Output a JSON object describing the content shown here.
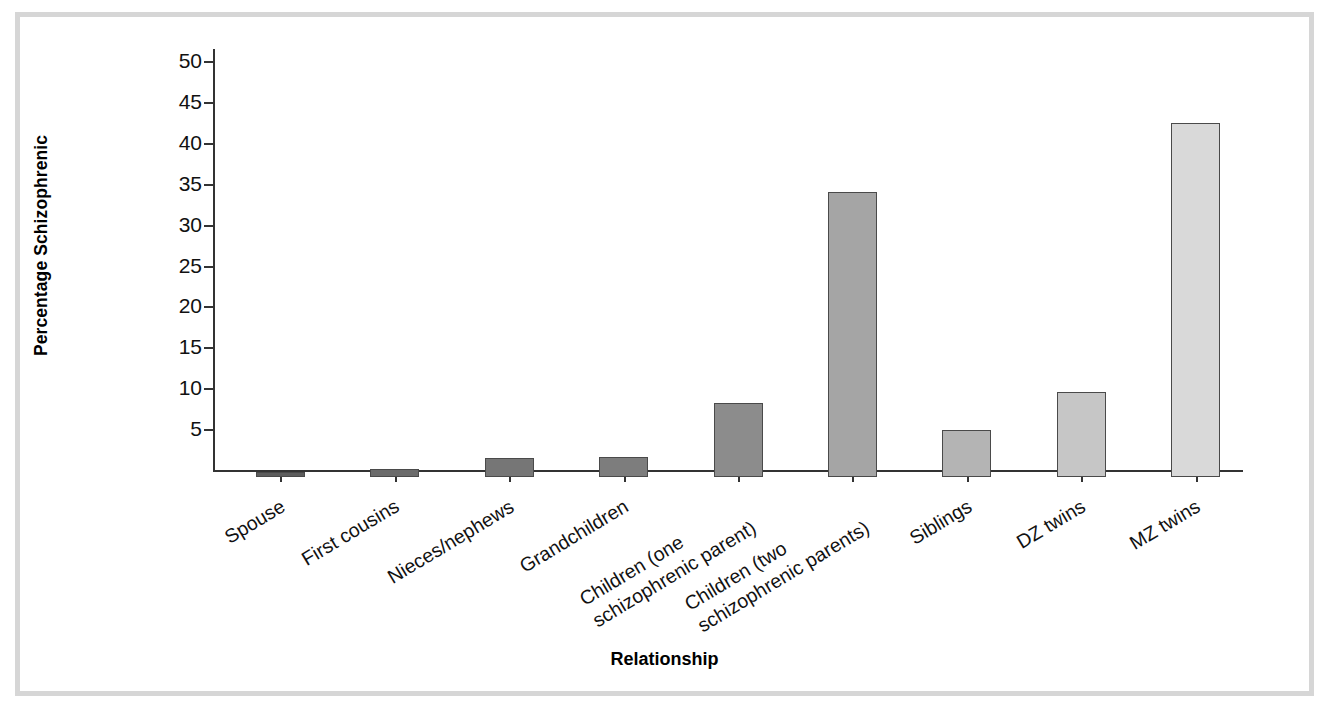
{
  "chart_data": {
    "type": "bar",
    "title": "",
    "xlabel": "Relationship",
    "ylabel": "Percentage Schizophrenic",
    "ylim": [
      0,
      50
    ],
    "ytick_step": 5,
    "yticks": [
      5,
      10,
      15,
      20,
      25,
      30,
      35,
      40,
      45,
      50
    ],
    "grid": false,
    "legend": null,
    "categories": [
      "Spouse",
      "First cousins",
      "Nieces/nephews",
      "Grandchildren",
      "Children (one schizophrenic parent)",
      "Children (two schizophrenic parents)",
      "Siblings",
      "DZ twins",
      "MZ twins"
    ],
    "values": [
      0.6,
      1.0,
      2.3,
      2.4,
      9.1,
      34.9,
      5.8,
      10.4,
      43.3
    ],
    "bar_colors": [
      "#5d5d5d",
      "#6b6b6b",
      "#767676",
      "#7d7d7d",
      "#8c8c8c",
      "#a5a5a5",
      "#b4b4b4",
      "#c6c6c6",
      "#d9d9d9"
    ],
    "bar_edge_color": "#4a4a4a"
  },
  "axis": {
    "y_tick_labels": [
      "5",
      "10",
      "15",
      "20",
      "25",
      "30",
      "35",
      "40",
      "45",
      "50"
    ],
    "y_title": "Percentage Schizophrenic",
    "x_title": "Relationship"
  },
  "category_labels": [
    {
      "line1": "Spouse",
      "line2": ""
    },
    {
      "line1": "First cousins",
      "line2": ""
    },
    {
      "line1": "Nieces/nephews",
      "line2": ""
    },
    {
      "line1": "Grandchildren",
      "line2": ""
    },
    {
      "line1": "Children (one",
      "line2": "schizophrenic parent)"
    },
    {
      "line1": "Children (two",
      "line2": "schizophrenic parents)"
    },
    {
      "line1": "Siblings",
      "line2": ""
    },
    {
      "line1": "DZ twins",
      "line2": ""
    },
    {
      "line1": "MZ twins",
      "line2": ""
    }
  ],
  "frame": {
    "border_color": "#d6d6d6"
  }
}
